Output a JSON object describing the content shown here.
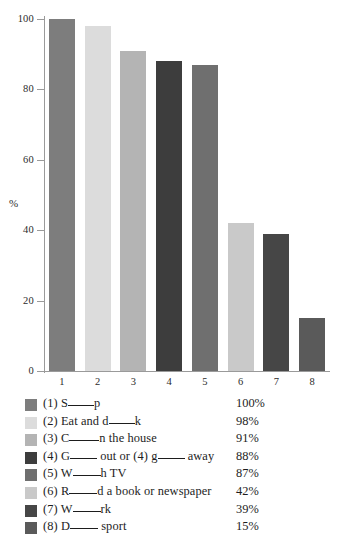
{
  "title_partial": "What do the British do at weekends?",
  "chart_data": {
    "type": "bar",
    "title": "What do the British do at weekends?",
    "xlabel": "",
    "ylabel": "%",
    "ylim": [
      0,
      100
    ],
    "yticks": [
      0,
      20,
      40,
      60,
      80,
      100
    ],
    "grid": false,
    "legend_position": "below",
    "categories": [
      "1",
      "2",
      "3",
      "4",
      "5",
      "6",
      "7",
      "8"
    ],
    "values": [
      100,
      98,
      91,
      88,
      87,
      42,
      39,
      15
    ],
    "bar_colors": [
      "#7d7d7d",
      "#dcdcdc",
      "#b4b4b4",
      "#3d3d3d",
      "#6f6f6f",
      "#c9c9c9",
      "#464646",
      "#5a5a5a"
    ],
    "legend": [
      {
        "index": "(1)",
        "pre": "S",
        "post": "p",
        "value": "100%",
        "color": "#7d7d7d",
        "blank_width": 26
      },
      {
        "index": "(2)",
        "pre": "Eat and d",
        "post": "k",
        "value": "98%",
        "color": "#dcdcdc",
        "blank_width": 26
      },
      {
        "index": "(3)",
        "pre": "C",
        "post": "n the house",
        "value": "91%",
        "color": "#b4b4b4",
        "blank_width": 30
      },
      {
        "index": "(4)",
        "pre": "G",
        "mid": " out or (4) g",
        "post": " away",
        "value": "88%",
        "color": "#3d3d3d",
        "blank_width": 27,
        "blank2_width": 27
      },
      {
        "index": "(5)",
        "pre": "W",
        "post": "h TV",
        "value": "87%",
        "color": "#6f6f6f",
        "blank_width": 28
      },
      {
        "index": "(6)",
        "pre": "R",
        "post": "d a book or newspaper",
        "value": "42%",
        "color": "#c9c9c9",
        "blank_width": 28
      },
      {
        "index": "(7)",
        "pre": "W",
        "post": "rk",
        "value": "39%",
        "color": "#464646",
        "blank_width": 28
      },
      {
        "index": "(8)",
        "pre": "D",
        "post": " sport",
        "value": "15%",
        "color": "#5a5a5a",
        "blank_width": 28
      }
    ]
  }
}
